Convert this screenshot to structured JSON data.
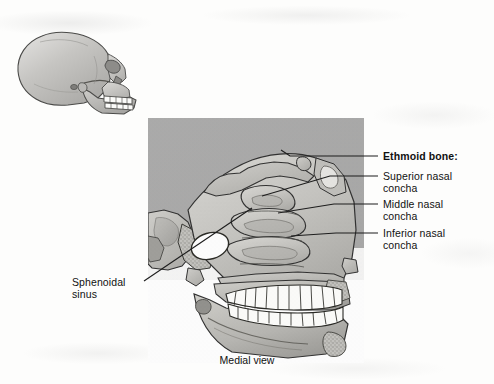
{
  "figure": {
    "caption": "Medial view",
    "background_color": "#fdfdfc",
    "plate_background_color": "#a8a8a8",
    "bone_fill_color": "#c9c8c4",
    "tooth_fill_color": "#fdfdfb",
    "outline_color": "#2b2b2b",
    "leader_color": "#1d1d1d"
  },
  "labels": {
    "ethmoid_bone": "Ethmoid bone:",
    "superior_nasal_concha": "Superior nasal\nconcha",
    "middle_nasal_concha": "Middle nasal\nconcha",
    "inferior_nasal_concha": "Inferior nasal\nconcha",
    "sphenoidal_sinus": "Sphenoidal\nsinus"
  },
  "inset": {
    "name": "lateral-skull-orientation-inset",
    "description": "Lateral view of whole skull"
  },
  "structures": [
    {
      "name": "ethmoid-bone",
      "label": "Ethmoid bone:"
    },
    {
      "name": "superior-nasal-concha",
      "label": "Superior nasal concha"
    },
    {
      "name": "middle-nasal-concha",
      "label": "Middle nasal concha"
    },
    {
      "name": "inferior-nasal-concha",
      "label": "Inferior nasal concha"
    },
    {
      "name": "sphenoidal-sinus",
      "label": "Sphenoidal sinus"
    }
  ]
}
